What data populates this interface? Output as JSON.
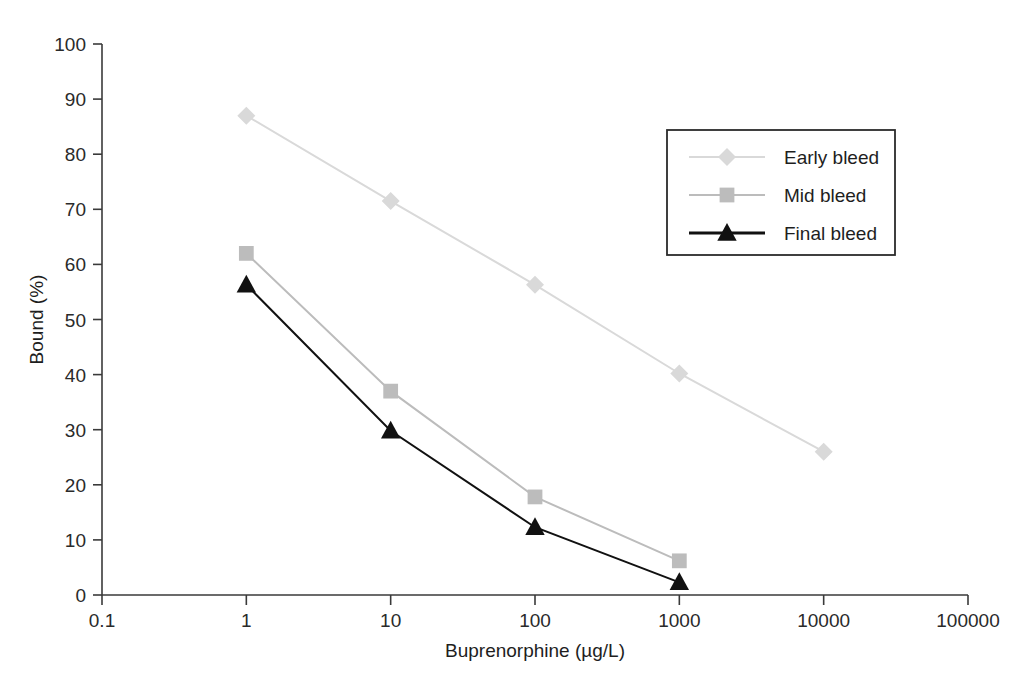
{
  "chart_data": {
    "type": "line",
    "title": "",
    "xlabel": "Buprenorphine (µg/L)",
    "ylabel": "Bound (%)",
    "x_scale": "log",
    "xlim": [
      0.1,
      100000
    ],
    "ylim": [
      0,
      100
    ],
    "x_ticks": [
      "0.1",
      "1",
      "10",
      "100",
      "1000",
      "10000",
      "100000"
    ],
    "x_tick_values": [
      0.1,
      1,
      10,
      100,
      1000,
      10000,
      100000
    ],
    "y_ticks": [
      "0",
      "10",
      "20",
      "30",
      "40",
      "50",
      "60",
      "70",
      "80",
      "90",
      "100"
    ],
    "y_tick_values": [
      0,
      10,
      20,
      30,
      40,
      50,
      60,
      70,
      80,
      90,
      100
    ],
    "grid": false,
    "legend_position": "upper-right",
    "series": [
      {
        "name": "Early bleed",
        "marker": "diamond",
        "color": "#d9d9d9",
        "x": [
          1,
          10,
          100,
          1000,
          10000
        ],
        "values": [
          87,
          71.5,
          56.3,
          40.2,
          26
        ]
      },
      {
        "name": "Mid bleed",
        "marker": "square",
        "color": "#bcbcbc",
        "x": [
          1,
          10,
          100,
          1000
        ],
        "values": [
          62,
          37,
          17.8,
          6.2
        ]
      },
      {
        "name": "Final bleed",
        "marker": "triangle",
        "color": "#111111",
        "x": [
          1,
          10,
          100,
          1000
        ],
        "values": [
          56.3,
          29.8,
          12.3,
          2.3
        ]
      }
    ]
  },
  "legend": {
    "items": [
      {
        "label": "Early bleed"
      },
      {
        "label": "Mid bleed"
      },
      {
        "label": "Final bleed"
      }
    ]
  },
  "axes": {
    "x_title": "Buprenorphine (µg/L)",
    "y_title": "Bound (%)"
  }
}
